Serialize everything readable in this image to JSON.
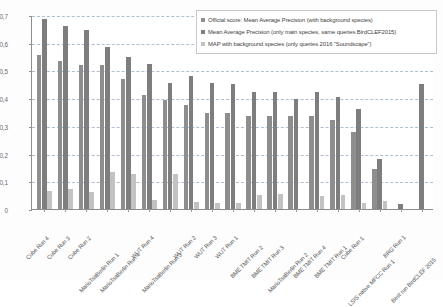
{
  "chart_data": {
    "type": "bar",
    "title": "",
    "subtitle": "",
    "xlabel": "",
    "ylabel": "",
    "ylim": [
      0,
      0.7
    ],
    "ytick_labels": [
      "0,7",
      "0,6",
      "0,5",
      "0,4",
      "0,3",
      "0,2",
      "0,1",
      "0"
    ],
    "ytick_values": [
      0.7,
      0.6,
      0.5,
      0.4,
      0.3,
      0.2,
      0.1,
      0
    ],
    "grid": "horizontal-dashed",
    "legend_position": "top-right",
    "decimal_separator": ",",
    "categories": [
      "Cube Run 4",
      "Cube Run 3",
      "Cube Run 2",
      "MarioTsaBerlin Run 1",
      "MarioTsaBerlin Run 4",
      "WUT Run 4",
      "MarioTsaBerlin Run 3",
      "WUT Run 2",
      "WUT Run 3",
      "WUT Run 1",
      "BME TMIT Run 2",
      "BME TMIT Run 3",
      "MarioTsaBerlin Run 2",
      "BME TMIT Run 4",
      "BME TMIT Run 1",
      "Cube Run 1",
      "LSIS native MFCC Run 1",
      "BRG Run 1",
      "Best run BirdCLEF 2015"
    ],
    "series": [
      {
        "name": "Official score: Mean Average Precision (with background species)",
        "color": "#8e8e8e",
        "values": [
          0.555,
          0.535,
          0.52,
          0.518,
          0.47,
          0.412,
          0.394,
          0.374,
          0.348,
          0.347,
          0.335,
          0.335,
          0.334,
          0.334,
          0.322,
          0.277,
          0.145,
          0.0,
          0.0
        ]
      },
      {
        "name": "Mean Average Precision (only main species, same queries BirdCLEF2015)",
        "color": "#7e7e7e",
        "values": [
          0.685,
          0.66,
          0.645,
          0.583,
          0.548,
          0.525,
          0.453,
          0.479,
          0.453,
          0.452,
          0.424,
          0.424,
          0.398,
          0.423,
          0.404,
          0.36,
          0.18,
          0.018,
          0.451
        ]
      },
      {
        "name": "MAP with background species (only queries 2016 \"Soundscape\")",
        "color": "#c2c2c2",
        "values": [
          0.065,
          0.073,
          0.062,
          0.132,
          0.127,
          0.033,
          0.125,
          0.027,
          0.022,
          0.021,
          0.049,
          0.053,
          0.0,
          0.047,
          0.049,
          0.02,
          0.03,
          0.0,
          0.0
        ]
      }
    ]
  },
  "legend": {
    "entries": [
      "Official score: Mean Average Precision (with background species)",
      "Mean Average Precision (only main species, same queries BirdCLEF2015)",
      "MAP with background species (only queries 2016 \"Soundscape\")"
    ]
  },
  "colors": {
    "series1": "#8e8e8e",
    "series2": "#7e7e7e",
    "series3": "#c2c2c2",
    "grid": "#9fb4cf",
    "axis": "#8d8d8d",
    "text": "#585858"
  }
}
